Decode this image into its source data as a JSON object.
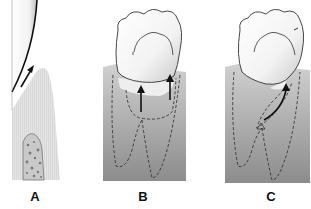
{
  "figure": {
    "panels": [
      {
        "id": "A",
        "label": "A",
        "description": "Cross-section of tooth surface and gingiva with upward arrow along tooth, alveolar bone below"
      },
      {
        "id": "B",
        "label": "B",
        "description": "Molar crown with two vertical upward arrows into gingival tissue; dashed root outlines"
      },
      {
        "id": "C",
        "label": "C",
        "description": "Molar crown with curved arrow along root from a triangular point; dashed root outlines"
      }
    ],
    "colors": {
      "gingiva_light": "#e3e3e3",
      "gingiva_gradient_top": "#cfcfcf",
      "gingiva_gradient_bottom": "#8a8a8a",
      "tooth": "#ffffff",
      "outline": "#222222"
    }
  }
}
